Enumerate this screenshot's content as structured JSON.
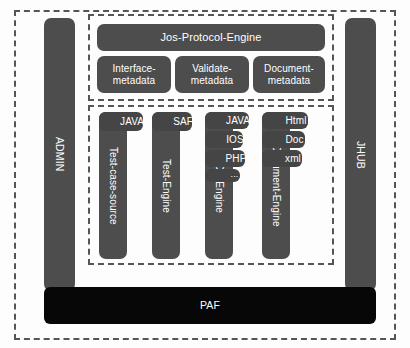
{
  "diagram": {
    "colors": {
      "node": "#4d4d4d",
      "tab": "#454545",
      "platform": "#070707",
      "frame": "#555555",
      "background": "#fdfdfd",
      "text": "#ffffff"
    },
    "pillars": {
      "left": {
        "label": "ADMIN"
      },
      "right": {
        "label": "JHUB"
      }
    },
    "protocol_section": {
      "engine": {
        "label": "Jos-Protocol-Engine"
      },
      "metadata": [
        {
          "label": "Interface-metadata"
        },
        {
          "label": "Validate-metadata"
        },
        {
          "label": "Document-metadata"
        }
      ]
    },
    "engine_section": {
      "columns": [
        {
          "label": "Test-case-source",
          "tabs": [
            {
              "label": "JAVA"
            }
          ]
        },
        {
          "label": "Test-Engine",
          "tabs": [
            {
              "label": "SAF"
            }
          ]
        },
        {
          "label": "SDK-Engine",
          "tabs": [
            {
              "label": "JAVA"
            },
            {
              "label": "IOS"
            },
            {
              "label": "PHP"
            },
            {
              "label": "..."
            }
          ]
        },
        {
          "label": "Document-Engine",
          "tabs": [
            {
              "label": "Html"
            },
            {
              "label": "Doc"
            },
            {
              "label": "xml"
            }
          ]
        }
      ]
    },
    "platform": {
      "label": "PAF"
    }
  }
}
